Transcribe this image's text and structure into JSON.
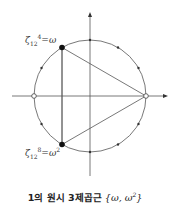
{
  "diagram": {
    "type": "unit-circle-roots-of-unity",
    "circle": {
      "cx": 90,
      "cy": 96,
      "r": 56
    },
    "points_12th_roots": 12,
    "highlighted": [
      {
        "name": "omega",
        "angle_deg": 120
      },
      {
        "name": "omega_squared",
        "angle_deg": 240
      }
    ],
    "open_points": [
      {
        "angle_deg": 0
      },
      {
        "angle_deg": 180
      }
    ],
    "triangle_vertices_deg": [
      0,
      120,
      240
    ]
  },
  "labels": {
    "omega": {
      "zeta": "ζ",
      "sub": "12",
      "sup": "4",
      "eq": "=ω"
    },
    "omega2": {
      "zeta": "ζ",
      "sub": "12",
      "sup": "8",
      "eq": "=ω",
      "eq_sup": "2"
    }
  },
  "caption": {
    "text": "1의 원시 3제곱근",
    "math": "{ω, ω",
    "math_sup": "2",
    "math_end": "}"
  }
}
